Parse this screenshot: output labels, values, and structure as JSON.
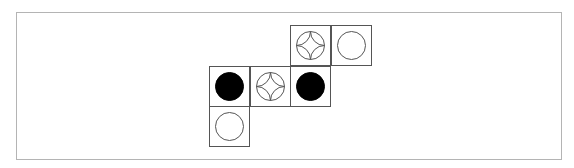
{
  "board": {
    "cells": [
      {
        "row": 0,
        "col": 2,
        "piece": "star"
      },
      {
        "row": 0,
        "col": 3,
        "piece": "white"
      },
      {
        "row": 1,
        "col": 0,
        "piece": "black"
      },
      {
        "row": 1,
        "col": 1,
        "piece": "star"
      },
      {
        "row": 1,
        "col": 2,
        "piece": "black"
      },
      {
        "row": 2,
        "col": 0,
        "piece": "white"
      }
    ],
    "piece_types": {
      "black": {
        "icon": "filled-black-circle-icon",
        "fill": "#000000"
      },
      "white": {
        "icon": "empty-white-circle-icon",
        "fill": "#ffffff"
      },
      "star": {
        "icon": "four-point-star-in-circle-icon",
        "fill": "#ffffff"
      }
    },
    "line_color": "#555555"
  }
}
